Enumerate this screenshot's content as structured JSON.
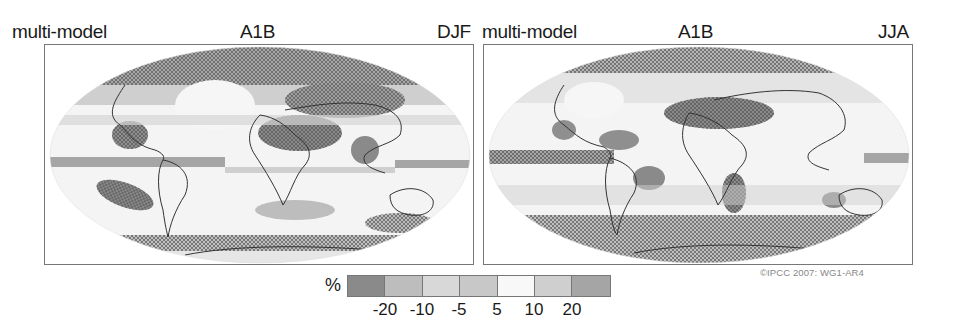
{
  "panels": [
    {
      "left_label": "multi-model",
      "center_label": "A1B",
      "right_label": "DJF",
      "season": "DJF"
    },
    {
      "left_label": "multi-model",
      "center_label": "A1B",
      "right_label": "JJA",
      "season": "JJA"
    }
  ],
  "legend": {
    "unit": "%",
    "ticks": [
      "-20",
      "-10",
      "-5",
      "5",
      "10",
      "20"
    ],
    "colors": [
      "#8a8a8a",
      "#bdbdbd",
      "#d8d8d8",
      "#c8c8c8",
      "#f8f8f8",
      "#cfcfcf",
      "#a5a5a5"
    ],
    "bins": [
      "< -20",
      "-20 to -10",
      "-10 to -5",
      "-5 to 5",
      "5 to 10",
      "10 to 20",
      "> 20"
    ]
  },
  "credit": "©IPCC  2007: WG1-AR4",
  "map_info": {
    "projection": "Robinson (global)",
    "variable": "Precipitation change (%)",
    "stippling": "dotted hatching where models agree"
  }
}
